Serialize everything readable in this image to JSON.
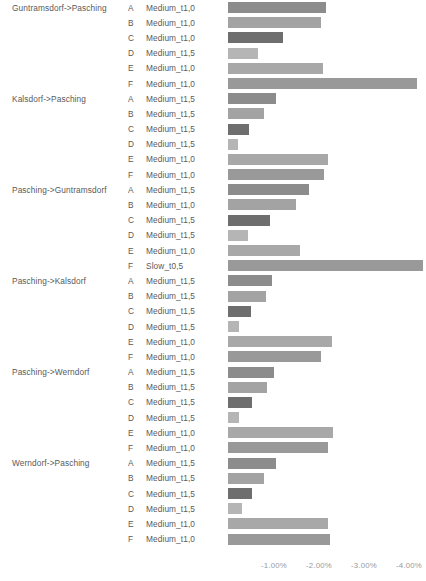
{
  "chart_data": {
    "type": "bar",
    "orientation": "horizontal",
    "title": "",
    "xlabel": "",
    "ylabel": "",
    "xlim": [
      0,
      -4.4
    ],
    "grid": false,
    "legend": null,
    "xticks": [
      "-1.00%",
      "-2.00%",
      "-3.00%",
      "-4.00%"
    ],
    "xtick_values": [
      -1.0,
      -2.0,
      -3.0,
      -4.0
    ],
    "columns": [
      "Route",
      "Scenario",
      "Type",
      "Value"
    ],
    "rows": [
      {
        "route": "Guntramsdorf->Pasching",
        "scenario": "A",
        "type": "Medium_t1,0",
        "value": -2.18
      },
      {
        "route": "",
        "scenario": "B",
        "type": "Medium_t1,0",
        "value": -2.07
      },
      {
        "route": "",
        "scenario": "C",
        "type": "Medium_t1,0",
        "value": -1.22
      },
      {
        "route": "",
        "scenario": "D",
        "type": "Medium_t1,5",
        "value": -0.66
      },
      {
        "route": "",
        "scenario": "E",
        "type": "Medium_t1,0",
        "value": -2.11
      },
      {
        "route": "",
        "scenario": "F",
        "type": "Medium_t1,0",
        "value": -4.19
      },
      {
        "route": "Kalsdorf->Pasching",
        "scenario": "A",
        "type": "Medium_t1,5",
        "value": -1.06
      },
      {
        "route": "",
        "scenario": "B",
        "type": "Medium_t1,5",
        "value": -0.8
      },
      {
        "route": "",
        "scenario": "C",
        "type": "Medium_t1,5",
        "value": -0.47
      },
      {
        "route": "",
        "scenario": "D",
        "type": "Medium_t1,5",
        "value": -0.22
      },
      {
        "route": "",
        "scenario": "E",
        "type": "Medium_t1,0",
        "value": -2.22
      },
      {
        "route": "",
        "scenario": "F",
        "type": "Medium_t1,0",
        "value": -2.13
      },
      {
        "route": "Pasching->Guntramsdorf",
        "scenario": "A",
        "type": "Medium_t1,5",
        "value": -1.8
      },
      {
        "route": "",
        "scenario": "B",
        "type": "Medium_t1,0",
        "value": -1.52
      },
      {
        "route": "",
        "scenario": "C",
        "type": "Medium_t1,5",
        "value": -0.93
      },
      {
        "route": "",
        "scenario": "D",
        "type": "Medium_t1,5",
        "value": -0.44
      },
      {
        "route": "",
        "scenario": "E",
        "type": "Medium_t1,0",
        "value": -1.6
      },
      {
        "route": "",
        "scenario": "F",
        "type": "Slow_t0,5",
        "value": -4.33
      },
      {
        "route": "Pasching->Kalsdorf",
        "scenario": "A",
        "type": "Medium_t1,5",
        "value": -0.98
      },
      {
        "route": "",
        "scenario": "B",
        "type": "Medium_t1,5",
        "value": -0.84
      },
      {
        "route": "",
        "scenario": "C",
        "type": "Medium_t1,5",
        "value": -0.51
      },
      {
        "route": "",
        "scenario": "D",
        "type": "Medium_t1,5",
        "value": -0.24
      },
      {
        "route": "",
        "scenario": "E",
        "type": "Medium_t1,0",
        "value": -2.31
      },
      {
        "route": "",
        "scenario": "F",
        "type": "Medium_t1,0",
        "value": -2.06
      },
      {
        "route": "Pasching->Werndorf",
        "scenario": "A",
        "type": "Medium_t1,5",
        "value": -1.02
      },
      {
        "route": "",
        "scenario": "B",
        "type": "Medium_t1,5",
        "value": -0.86
      },
      {
        "route": "",
        "scenario": "C",
        "type": "Medium_t1,5",
        "value": -0.53
      },
      {
        "route": "",
        "scenario": "D",
        "type": "Medium_t1,5",
        "value": -0.24
      },
      {
        "route": "",
        "scenario": "E",
        "type": "Medium_t1,0",
        "value": -2.33
      },
      {
        "route": "",
        "scenario": "F",
        "type": "Medium_t1,0",
        "value": -2.22
      },
      {
        "route": "Werndorf->Pasching",
        "scenario": "A",
        "type": "Medium_t1,5",
        "value": -1.06
      },
      {
        "route": "",
        "scenario": "B",
        "type": "Medium_t1,5",
        "value": -0.8
      },
      {
        "route": "",
        "scenario": "C",
        "type": "Medium_t1,5",
        "value": -0.53
      },
      {
        "route": "",
        "scenario": "D",
        "type": "Medium_t1,5",
        "value": -0.31
      },
      {
        "route": "",
        "scenario": "E",
        "type": "Medium_t1,0",
        "value": -2.22
      },
      {
        "route": "",
        "scenario": "F",
        "type": "Medium_t1,0",
        "value": -2.27
      }
    ],
    "bar_colors": [
      "#8c8c8c",
      "#a3a3a3",
      "#6e6e6e",
      "#b5b5b5",
      "#a8a8a8",
      "#999999",
      "#8c8c8c",
      "#a3a3a3",
      "#6e6e6e",
      "#b5b5b5",
      "#a8a8a8",
      "#999999",
      "#8c8c8c",
      "#a3a3a3",
      "#6e6e6e",
      "#b5b5b5",
      "#a8a8a8",
      "#999999",
      "#8c8c8c",
      "#a3a3a3",
      "#6e6e6e",
      "#b5b5b5",
      "#a8a8a8",
      "#999999",
      "#8c8c8c",
      "#a3a3a3",
      "#6e6e6e",
      "#b5b5b5",
      "#a8a8a8",
      "#999999",
      "#8c8c8c",
      "#a3a3a3",
      "#6e6e6e",
      "#b5b5b5",
      "#a8a8a8",
      "#999999"
    ]
  }
}
